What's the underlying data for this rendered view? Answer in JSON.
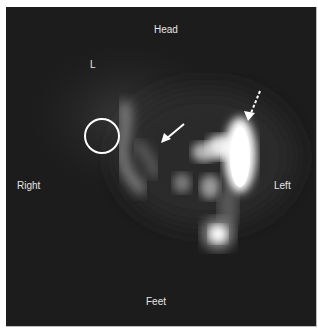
{
  "figure": {
    "labels": {
      "top": "Head",
      "bottom": "Feet",
      "left_side": "Right",
      "right_side": "Left",
      "marker": "L"
    },
    "annotations": [
      {
        "type": "circle",
        "meaning": "region of interest"
      },
      {
        "type": "solid-arrow",
        "meaning": "pointer to uptake"
      },
      {
        "type": "dashed-arrow",
        "meaning": "pointer to intense uptake"
      }
    ],
    "colors": {
      "background": "#1c1c1c",
      "annotation": "#ffffff",
      "label": "#e6e6e6"
    }
  }
}
